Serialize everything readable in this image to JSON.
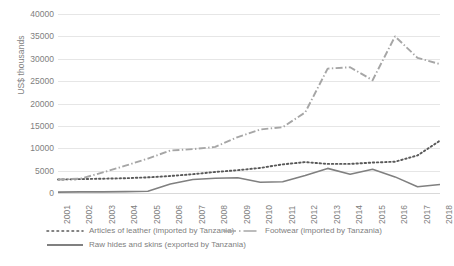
{
  "chart_data": {
    "type": "line",
    "title": "",
    "xlabel": "",
    "ylabel": "US$ thousands",
    "ylim": [
      0,
      40000
    ],
    "ytick_values": [
      0,
      5000,
      10000,
      15000,
      20000,
      25000,
      30000,
      35000,
      40000
    ],
    "ytick_labels": [
      "0",
      "5000",
      "10000",
      "15000",
      "20000",
      "25000",
      "30000",
      "35000",
      "40000"
    ],
    "grid": true,
    "legend_position": "bottom-left",
    "categories": [
      "2001",
      "2002",
      "2003",
      "2004",
      "2005",
      "2006",
      "2007",
      "2008",
      "2009",
      "2010",
      "2011",
      "2012",
      "2013",
      "2014",
      "2015",
      "2016",
      "2017",
      "2018"
    ],
    "series": [
      {
        "name": "Articles of leather (imported by Tanzania)",
        "style": "dotted",
        "color": "#595959",
        "values": [
          3000,
          3100,
          3200,
          3300,
          3500,
          3800,
          4200,
          4700,
          5100,
          5600,
          6400,
          6900,
          6500,
          6500,
          6800,
          7000,
          8400,
          11700
        ]
      },
      {
        "name": "Footwear (imported by Tanzania)",
        "style": "dash-dot",
        "color": "#a6a6a6",
        "values": [
          3000,
          3200,
          4600,
          6100,
          7700,
          9500,
          9800,
          10300,
          12500,
          14200,
          14700,
          18000,
          27800,
          28100,
          25200,
          35000,
          30200,
          28800
        ]
      },
      {
        "name": "Raw hides and skins (exported by Tanzania)",
        "style": "solid",
        "color": "#808080",
        "values": [
          200,
          250,
          250,
          300,
          400,
          2000,
          3000,
          3300,
          3400,
          2400,
          2500,
          3900,
          5500,
          4200,
          5300,
          3600,
          1400,
          1900
        ]
      }
    ]
  },
  "legend": {
    "items": [
      {
        "label": "Articles of leather (imported by Tanzania)",
        "style": "dotted"
      },
      {
        "label": "Footwear (imported by Tanzania)",
        "style": "dash-dot"
      },
      {
        "label": "Raw hides and skins (exported by Tanzania)",
        "style": "solid"
      }
    ]
  },
  "axis": {
    "y_title": "US$ thousands"
  },
  "colors": {
    "grid": "#e6e6e6",
    "text": "#808080",
    "series_leather": "#595959",
    "series_footwear": "#a6a6a6",
    "series_hides": "#808080",
    "background": "#ffffff"
  }
}
